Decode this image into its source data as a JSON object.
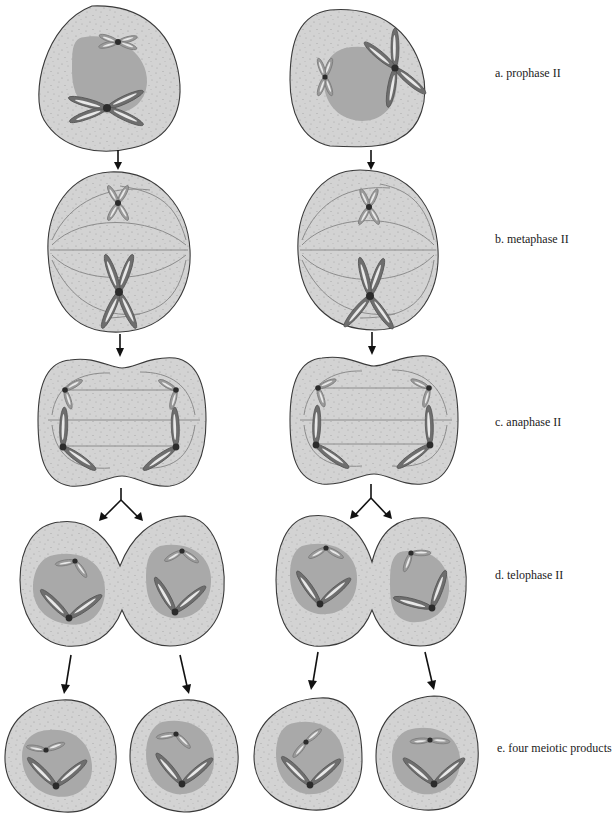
{
  "figure": {
    "stages": [
      {
        "id": "a",
        "label": "a. prophase II"
      },
      {
        "id": "b",
        "label": "b. metaphase II"
      },
      {
        "id": "c",
        "label": "c. anaphase II"
      },
      {
        "id": "d",
        "label": "d. telophase II"
      },
      {
        "id": "e",
        "label": "e. four meiotic products"
      }
    ],
    "colors": {
      "cytoplasm": "#d3d3d3",
      "nucleus": "#a9a9a9",
      "chromosome_dark": "#6e6e6e",
      "chromosome_light": "#9a9a9a",
      "centromere": "#2c2c2c",
      "outline": "#3a3a3a",
      "arrow": "#111111"
    },
    "columns": 2,
    "final_cells": 4
  }
}
